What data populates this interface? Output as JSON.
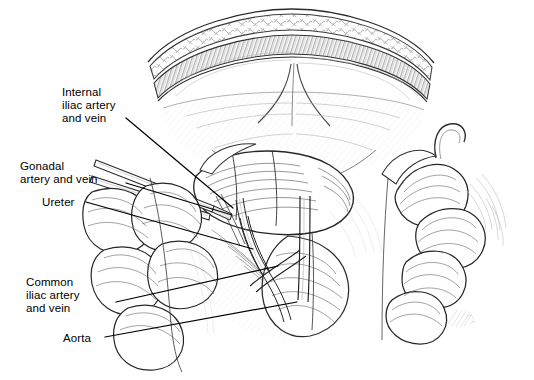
{
  "figure": {
    "kind": "line-art-medical-illustration",
    "background_color": "#ffffff",
    "ink_color": "#1a1a1a",
    "shade_color": "#6b6b6b",
    "width": 534,
    "height": 380
  },
  "labels": [
    {
      "id": "internal-iliac",
      "text": "Internal\niliac artery\nand vein",
      "lines": [
        "Internal",
        "iliac artery",
        "and vein"
      ],
      "x": 62,
      "y": 86,
      "leader": {
        "x1": 126,
        "y1": 118,
        "x2": 233,
        "y2": 208
      }
    },
    {
      "id": "gonadal",
      "text": "Gonadal\nartery and vein",
      "lines": [
        "Gonadal",
        "artery and vein"
      ],
      "x": 20,
      "y": 160,
      "leader": {
        "x1": 126,
        "y1": 183,
        "x2": 232,
        "y2": 215
      }
    },
    {
      "id": "ureter",
      "text": "Ureter",
      "lines": [
        "Ureter"
      ],
      "x": 42,
      "y": 196,
      "leader": {
        "x1": 86,
        "y1": 202,
        "x2": 253,
        "y2": 249
      }
    },
    {
      "id": "common-iliac",
      "text": "Common\niliac artery\nand vein",
      "lines": [
        "Common",
        "iliac artery",
        "and vein"
      ],
      "x": 26,
      "y": 276,
      "leader": {
        "x1": 116,
        "y1": 302,
        "x2": 278,
        "y2": 266
      }
    },
    {
      "id": "aorta",
      "text": "Aorta",
      "lines": [
        "Aorta"
      ],
      "x": 63,
      "y": 332,
      "leader": {
        "x1": 105,
        "y1": 337,
        "x2": 297,
        "y2": 302
      }
    }
  ],
  "signature": {
    "present": true,
    "x": 455,
    "y": 318,
    "legible": false
  }
}
